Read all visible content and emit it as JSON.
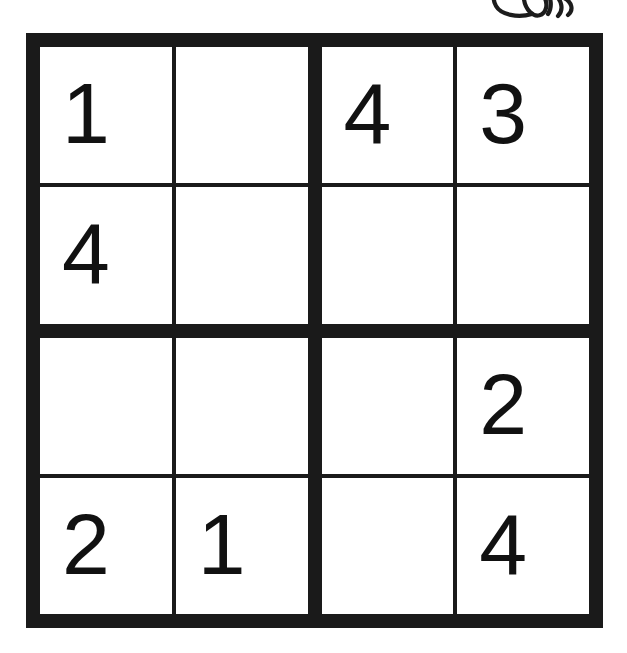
{
  "puzzle": {
    "type": "sudoku-4x4",
    "title": "4x4 Sudoku Grid",
    "colors": {
      "ink": "#1a1a1a",
      "digit": "#111111",
      "paper": "#ffffff"
    },
    "line_weights": {
      "outer_border_px": 14,
      "block_divider_px": 14,
      "cell_line_px": 4
    },
    "grid": {
      "rows": 4,
      "columns": 4,
      "block_rows": 2,
      "block_columns": 2
    },
    "cells": [
      [
        {
          "id": "r1c1",
          "value": "1",
          "given": true
        },
        {
          "id": "r1c2",
          "value": "",
          "given": false
        },
        {
          "id": "r1c3",
          "value": "4",
          "given": true
        },
        {
          "id": "r1c4",
          "value": "3",
          "given": true
        }
      ],
      [
        {
          "id": "r2c1",
          "value": "4",
          "given": true
        },
        {
          "id": "r2c2",
          "value": "",
          "given": false
        },
        {
          "id": "r2c3",
          "value": "",
          "given": false
        },
        {
          "id": "r2c4",
          "value": "",
          "given": false
        }
      ],
      [
        {
          "id": "r3c1",
          "value": "",
          "given": false
        },
        {
          "id": "r3c2",
          "value": "",
          "given": false
        },
        {
          "id": "r3c3",
          "value": "",
          "given": false
        },
        {
          "id": "r3c4",
          "value": "2",
          "given": true
        }
      ],
      [
        {
          "id": "r4c1",
          "value": "2",
          "given": true
        },
        {
          "id": "r4c2",
          "value": "1",
          "given": true
        },
        {
          "id": "r4c3",
          "value": "",
          "given": false
        },
        {
          "id": "r4c4",
          "value": "4",
          "given": true
        }
      ]
    ]
  },
  "annotations": {
    "doodle": {
      "name": "handwritten-scribble",
      "description": "ink scribble partially cut off at top edge"
    }
  }
}
